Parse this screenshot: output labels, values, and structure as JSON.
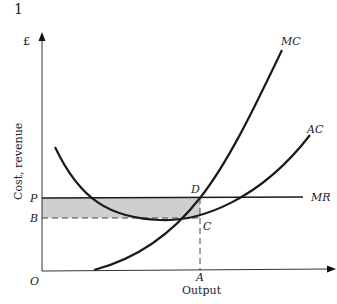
{
  "figure": {
    "number": "1",
    "y_axis_unit": "£",
    "y_axis_title": "Cost, revenue",
    "x_axis_title": "Output",
    "origin_label": "O"
  },
  "labels": {
    "P": "P",
    "B": "B",
    "D": "D",
    "C": "C",
    "A": "A",
    "MC": "MC",
    "AC": "AC",
    "MR": "MR"
  },
  "colors": {
    "line": "#1a1a1a",
    "shade": "#cfcfcf",
    "axis": "#333333"
  },
  "diagram": {
    "type": "economics-cost-revenue",
    "curves": [
      "MC",
      "AC",
      "MR"
    ],
    "shaded_region": "Profit area between P and B from O to A",
    "points": {
      "D": "MC = MR at output A, price P",
      "C": "AC at output A, level B"
    }
  }
}
